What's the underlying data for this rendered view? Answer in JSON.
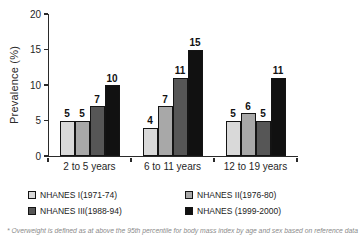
{
  "chart_data": {
    "type": "bar",
    "title": "",
    "xlabel": "",
    "ylabel": "Prevalence (%)",
    "ylim": [
      0,
      20
    ],
    "yticks": [
      0,
      5,
      10,
      15,
      20
    ],
    "grid": false,
    "legend_position": "bottom",
    "categories": [
      "2 to 5 years",
      "6 to 11 years",
      "12 to 19 years"
    ],
    "series": [
      {
        "name": "NHANES I(1971-74)",
        "color": "#d9d9d9",
        "values": [
          5,
          4,
          5
        ]
      },
      {
        "name": "NHANES II(1976-80)",
        "color": "#a8a8a8",
        "values": [
          5,
          7,
          6
        ]
      },
      {
        "name": "NHANES III(1988-94)",
        "color": "#565656",
        "values": [
          7,
          11,
          5
        ]
      },
      {
        "name": "NHANES (1999-2000)",
        "color": "#111111",
        "values": [
          10,
          15,
          11
        ]
      }
    ]
  },
  "footnote": "* Overweight is defined as at above the 95th percentile for body mass index by age and sex based on reference data"
}
